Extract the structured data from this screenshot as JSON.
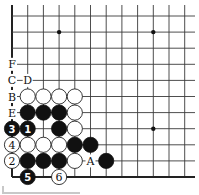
{
  "diagram": {
    "type": "go-board-corner",
    "grid": {
      "columns": 12,
      "rows": 11,
      "origin_x": 12,
      "origin_y": 16,
      "spacing_x": 15.7,
      "spacing_y": 16.1,
      "left_edge": true,
      "bottom_edge": true
    },
    "star_points": [
      {
        "c": 3,
        "r": 1
      },
      {
        "c": 9,
        "r": 1
      },
      {
        "c": 9,
        "r": 7
      }
    ],
    "stones": [
      {
        "c": 1,
        "r": 5,
        "color": "white"
      },
      {
        "c": 2,
        "r": 5,
        "color": "white"
      },
      {
        "c": 3,
        "r": 5,
        "color": "white"
      },
      {
        "c": 4,
        "r": 5,
        "color": "white"
      },
      {
        "c": 1,
        "r": 6,
        "color": "black"
      },
      {
        "c": 2,
        "r": 6,
        "color": "black"
      },
      {
        "c": 3,
        "r": 6,
        "color": "black"
      },
      {
        "c": 4,
        "r": 6,
        "color": "white"
      },
      {
        "c": 0,
        "r": 7,
        "color": "black",
        "number": "3"
      },
      {
        "c": 1,
        "r": 7,
        "color": "black",
        "number": "1"
      },
      {
        "c": 3,
        "r": 7,
        "color": "black"
      },
      {
        "c": 4,
        "r": 7,
        "color": "white"
      },
      {
        "c": 0,
        "r": 8,
        "color": "white",
        "number": "4"
      },
      {
        "c": 1,
        "r": 8,
        "color": "white"
      },
      {
        "c": 2,
        "r": 8,
        "color": "white"
      },
      {
        "c": 3,
        "r": 8,
        "color": "white"
      },
      {
        "c": 4,
        "r": 8,
        "color": "black"
      },
      {
        "c": 5,
        "r": 8,
        "color": "black"
      },
      {
        "c": 0,
        "r": 9,
        "color": "white",
        "number": "2"
      },
      {
        "c": 1,
        "r": 9,
        "color": "black"
      },
      {
        "c": 2,
        "r": 9,
        "color": "black"
      },
      {
        "c": 3,
        "r": 9,
        "color": "black"
      },
      {
        "c": 4,
        "r": 9,
        "color": "white"
      },
      {
        "c": 6,
        "r": 9,
        "color": "black"
      },
      {
        "c": 1,
        "r": 10,
        "color": "black",
        "number": "5"
      },
      {
        "c": 3,
        "r": 10,
        "color": "white",
        "number": "6"
      }
    ],
    "labels": [
      {
        "c": 0,
        "r": 3,
        "text": "F"
      },
      {
        "c": 0,
        "r": 4,
        "text": "C"
      },
      {
        "c": 1,
        "r": 4,
        "text": "D"
      },
      {
        "c": 0,
        "r": 5,
        "text": "B"
      },
      {
        "c": 0,
        "r": 6,
        "text": "E"
      },
      {
        "c": 5,
        "r": 9,
        "text": "A"
      }
    ]
  }
}
